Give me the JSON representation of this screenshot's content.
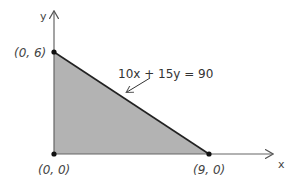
{
  "diagram": {
    "type": "feasible-region",
    "axes": {
      "x_label": "x",
      "y_label": "y"
    },
    "vertices": [
      {
        "label": "(0, 6)",
        "x": 0,
        "y": 6
      },
      {
        "label": "(0, 0)",
        "x": 0,
        "y": 0
      },
      {
        "label": "(9, 0)",
        "x": 9,
        "y": 0
      }
    ],
    "constraint_line": {
      "equation": "10x + 15y = 90"
    },
    "colors": {
      "region_fill": "#b3b3b3",
      "line": "#222222",
      "axis": "#666666"
    }
  }
}
